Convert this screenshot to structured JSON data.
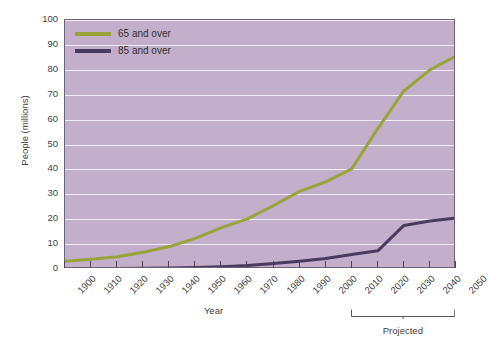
{
  "chart_data": {
    "type": "line",
    "title": "",
    "xlabel": "Year",
    "ylabel": "People (millions)",
    "xlim": [
      1900,
      2050
    ],
    "ylim": [
      0,
      100
    ],
    "grid": true,
    "legend_position": "top-left",
    "x": [
      1900,
      1910,
      1920,
      1930,
      1940,
      1950,
      1960,
      1970,
      1980,
      1990,
      2000,
      2010,
      2020,
      2030,
      2040,
      2050
    ],
    "xticklabels": [
      "1900",
      "1910",
      "1920",
      "1930",
      "1940",
      "1950",
      "1960",
      "1970",
      "1980",
      "1990",
      "2000",
      "2010",
      "2020",
      "2030",
      "2040",
      "2050"
    ],
    "yticks": [
      0,
      10,
      20,
      30,
      40,
      50,
      60,
      70,
      80,
      90,
      100
    ],
    "yticklabels": [
      "0",
      "10",
      "20",
      "30",
      "40",
      "50",
      "60",
      "70",
      "80",
      "90",
      "100"
    ],
    "series": [
      {
        "name": "65 and over",
        "color": "#9aa338",
        "values": [
          3.1,
          3.9,
          4.9,
          6.7,
          9.0,
          12.3,
          16.6,
          20.1,
          25.5,
          31.2,
          35.0,
          40.2,
          56.4,
          71.5,
          80.0,
          85.5
        ]
      },
      {
        "name": "85 and over",
        "color": "#4a3a5e",
        "values": [
          0.1,
          0.2,
          0.2,
          0.3,
          0.4,
          0.6,
          0.9,
          1.4,
          2.2,
          3.1,
          4.2,
          5.8,
          7.3,
          17.5,
          19.3,
          20.5
        ]
      }
    ],
    "annotations": [
      {
        "label": "Projected",
        "span_start": 2010,
        "span_end": 2050,
        "type": "bracket"
      }
    ]
  },
  "legend": {
    "items": [
      {
        "label": "65 and over",
        "color": "#9aa338"
      },
      {
        "label": "85 and over",
        "color": "#4a3a5e"
      }
    ]
  },
  "axes": {
    "x_title": "Year",
    "y_title": "People (millions)"
  },
  "colors": {
    "plot_background": "#c3aecb",
    "gridline": "#f1ecf3",
    "frame": "#6e6478",
    "series_65": "#9aa338",
    "series_85": "#4a3a5e",
    "text": "#3f3f3f"
  }
}
